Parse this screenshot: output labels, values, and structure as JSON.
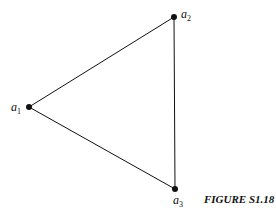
{
  "figure": {
    "caption": "FIGURE S1.18",
    "vertices": [
      {
        "id": "a1",
        "base": "a",
        "sub": "1",
        "x": 29,
        "y": 107
      },
      {
        "id": "a2",
        "base": "a",
        "sub": "2",
        "x": 174,
        "y": 17
      },
      {
        "id": "a3",
        "base": "a",
        "sub": "3",
        "x": 175,
        "y": 189
      }
    ],
    "edges": [
      [
        "a1",
        "a2"
      ],
      [
        "a2",
        "a3"
      ],
      [
        "a1",
        "a3"
      ]
    ],
    "colors": {
      "stroke": "#111111",
      "background": "#ffffff"
    }
  }
}
